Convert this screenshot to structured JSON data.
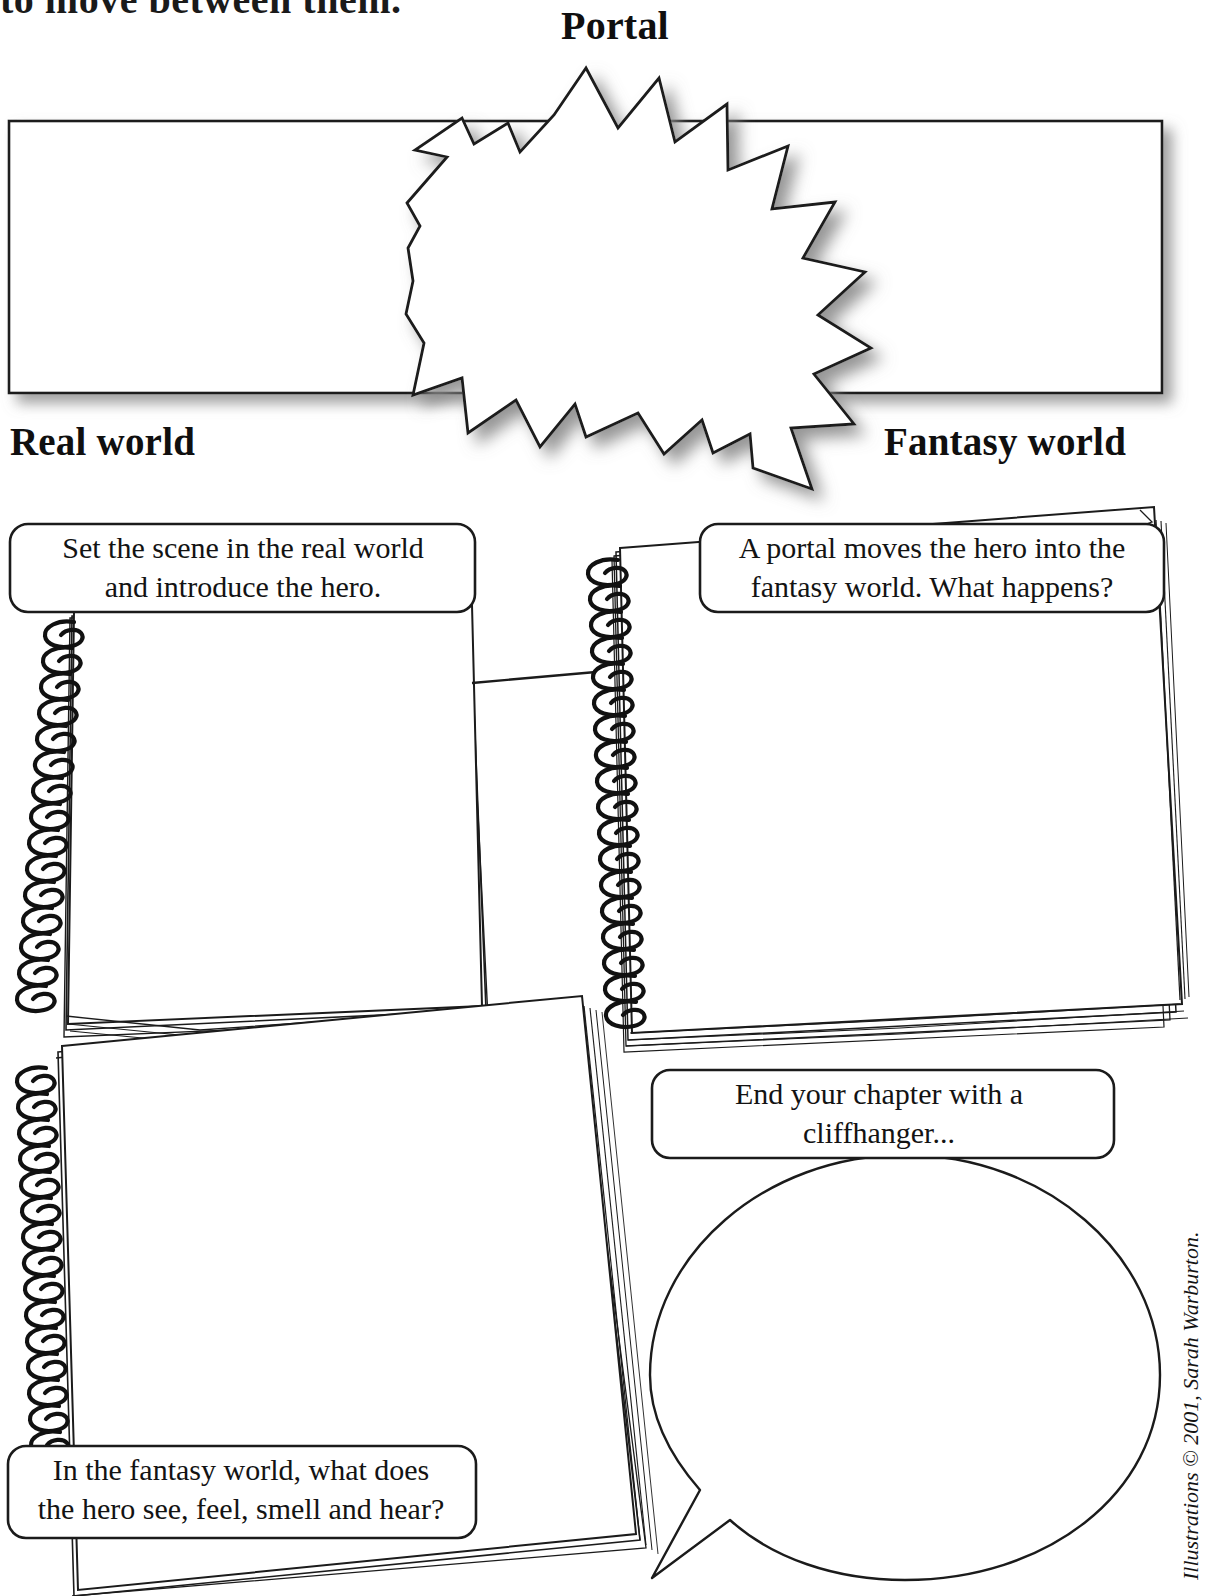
{
  "page": {
    "cut_off_top_line": "to move between them.",
    "title": "Portal",
    "left_zone_label": "Real world",
    "right_zone_label": "Fantasy world",
    "credit": "Illustrations © 2001, Sarah Warburton."
  },
  "banners": {
    "left_banner_label": "",
    "right_banner_label": "",
    "starburst_label": ""
  },
  "callouts": [
    {
      "id": "set-the-scene",
      "line1": "Set the scene in the real world",
      "line2": "and introduce the hero."
    },
    {
      "id": "portal-moves-hero",
      "line1": "A portal moves the hero into the",
      "line2": "fantasy world. What happens?"
    },
    {
      "id": "end-with-cliffhanger",
      "line1": "End your chapter with a",
      "line2": "cliffhanger..."
    },
    {
      "id": "senses-in-fantasy-world",
      "line1": "In the fantasy world, what does",
      "line2": "the hero see, feel, smell and hear?"
    }
  ],
  "writing_areas": {
    "notepad_top_left": "",
    "notepad_top_right": "",
    "notepad_bottom_left": "",
    "speech_bubble": ""
  },
  "colors": {
    "ink": "#111111",
    "paper": "#ffffff",
    "shadow": "#9a9a9a"
  }
}
